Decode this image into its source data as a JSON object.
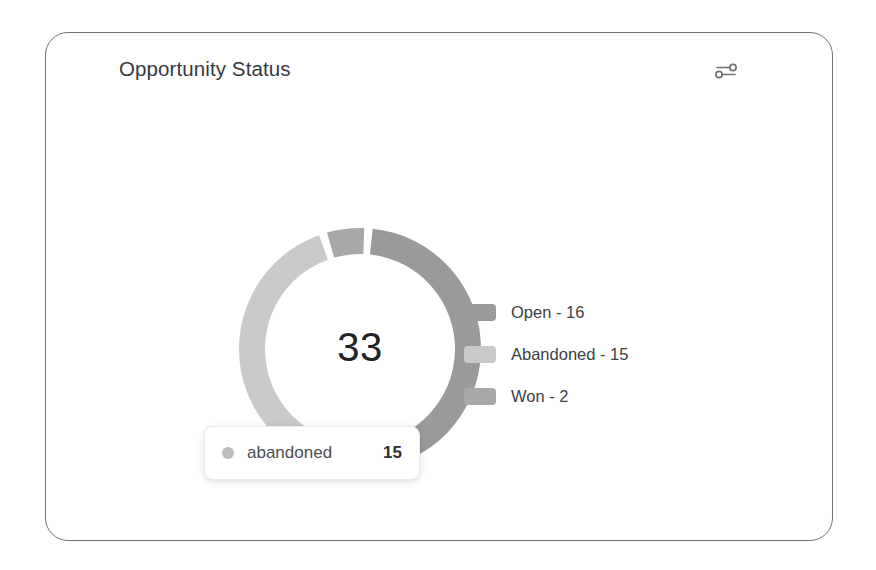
{
  "card": {
    "title": "Opportunity Status",
    "settings_icon": "sliders-icon",
    "border_color": "#6f7276",
    "background": "#ffffff"
  },
  "chart_data": {
    "type": "pie",
    "variant": "donut",
    "title": "Opportunity Status",
    "categories": [
      "Open",
      "Abandoned",
      "Won"
    ],
    "values": [
      16,
      15,
      2
    ],
    "total": 33,
    "center_label": "33",
    "colors": [
      "#9a9a9a",
      "#c9c9c9",
      "#a8a8a8"
    ],
    "legend_position": "right",
    "legend_entries": [
      "Open - 16",
      "Abandoned - 15",
      "Won - 2"
    ],
    "gap_degrees": 4,
    "start_angle_degrees": 4,
    "inner_radius": 95,
    "outer_radius": 121
  },
  "legend": {
    "items": [
      {
        "label": "Open - 16",
        "color": "#9a9a9a",
        "name": "Open",
        "value": 16
      },
      {
        "label": "Abandoned - 15",
        "color": "#c9c9c9",
        "name": "Abandoned",
        "value": 15
      },
      {
        "label": "Won - 2",
        "color": "#a8a8a8",
        "name": "Won",
        "value": 2
      }
    ]
  },
  "tooltip": {
    "visible": true,
    "series_name": "abandoned",
    "value": "15",
    "dot_color": "#bdbdbd"
  }
}
